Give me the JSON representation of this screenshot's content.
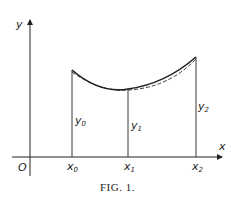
{
  "figure": {
    "caption": "FIG. 1.",
    "axes": {
      "x_label": "x",
      "y_label": "y",
      "origin_label": "O"
    },
    "points": [
      {
        "x_label": "x",
        "x_sub": "0",
        "y_label": "y",
        "y_sub": "0"
      },
      {
        "x_label": "x",
        "x_sub": "1",
        "y_label": "y",
        "y_sub": "1"
      },
      {
        "x_label": "x",
        "x_sub": "2",
        "y_label": "y",
        "y_sub": "2"
      }
    ],
    "curves": [
      {
        "name": "solid-curve",
        "style": "solid"
      },
      {
        "name": "dashed-approximation",
        "style": "dashed"
      }
    ],
    "colors": {
      "ink": "#222222",
      "background": "#ffffff"
    }
  }
}
